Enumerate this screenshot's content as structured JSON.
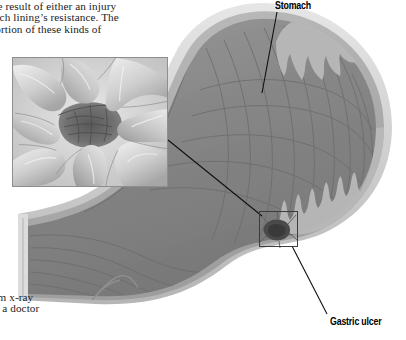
{
  "figure": {
    "type": "medical-illustration",
    "palette": {
      "background": "#ffffff",
      "wall_outer": "#d9d9d9",
      "wall_muscle": "#a8a8a8",
      "mucosa": "#8a8a8a",
      "lumen": "#7f7f7f",
      "fold_line": "#6a6a6a",
      "ulcer_crater": "#4a4a4a",
      "label_text": "#000000",
      "body_text": "#1b1b1b",
      "leader_line": "#111111",
      "inset_border": "#8e8e8e"
    }
  },
  "body_text_top": {
    "lines": [
      "y the result of either an injury",
      "omach lining’s resistance. The",
      "roportion of these kinds of"
    ]
  },
  "body_text_bottom": {
    "lines": [
      "barium x-ray",
      "ereby a doctor",
      "e."
    ]
  },
  "labels": {
    "stomach": "Stomach",
    "gastric_ulcer": "Gastric ulcer"
  },
  "inset": {
    "caption": "",
    "depicts": "close-up of gastric ulcer crater surrounded by radiating mucosal folds"
  },
  "callout": {
    "depicts": "ulcer site on stomach wall"
  }
}
